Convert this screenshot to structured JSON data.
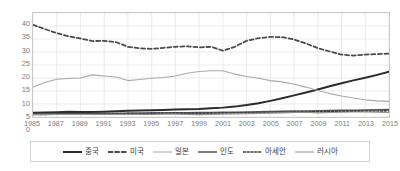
{
  "chart_data": {
    "type": "line",
    "title": "",
    "xlabel": "",
    "ylabel": "",
    "ylim": [
      0,
      40
    ],
    "ytick_step": 5,
    "grid": true,
    "legend_position": "bottom",
    "yticks": [
      "40",
      "35",
      "30",
      "25",
      "20",
      "15",
      "10",
      "5",
      "0"
    ],
    "x": [
      1985,
      1986,
      1987,
      1988,
      1989,
      1990,
      1991,
      1992,
      1993,
      1994,
      1995,
      1996,
      1997,
      1998,
      1999,
      2000,
      2001,
      2002,
      2003,
      2004,
      2005,
      2006,
      2007,
      2008,
      2009,
      2010,
      2011,
      2012,
      2013,
      2014,
      2015
    ],
    "xtick_labels": [
      "1985",
      "1987",
      "1989",
      "1991",
      "1993",
      "1995",
      "1997",
      "1999",
      "2001",
      "2003",
      "2005",
      "2007",
      "2009",
      "2011",
      "2013",
      "2015"
    ],
    "series": [
      {
        "name": "중국",
        "style": "solid",
        "width": 2.0,
        "color": "#2b2b2b",
        "values": [
          1.6,
          1.7,
          1.8,
          2.0,
          1.9,
          1.9,
          2.0,
          2.2,
          2.4,
          2.5,
          2.6,
          2.7,
          2.9,
          3.0,
          3.1,
          3.4,
          3.6,
          4.0,
          4.6,
          5.3,
          6.2,
          7.2,
          8.3,
          9.4,
          10.6,
          11.8,
          13.0,
          14.1,
          15.1,
          16.2,
          17.4
        ]
      },
      {
        "name": "미국",
        "style": "dashed",
        "width": 1.8,
        "color": "#4a4a4a",
        "values": [
          35.5,
          33.8,
          32.3,
          31.0,
          30.2,
          29.2,
          29.3,
          28.8,
          27.0,
          26.4,
          26.2,
          26.6,
          27.0,
          27.2,
          26.8,
          27.0,
          25.5,
          27.0,
          29.3,
          30.3,
          30.8,
          30.7,
          29.8,
          28.3,
          26.5,
          25.2,
          24.0,
          23.6,
          24.0,
          24.2,
          24.4
        ]
      },
      {
        "name": "일본",
        "style": "solid",
        "width": 1.1,
        "color": "#a8a8a8",
        "values": [
          11.5,
          13.3,
          14.5,
          14.8,
          15.0,
          16.2,
          15.8,
          15.4,
          14.0,
          14.4,
          14.9,
          15.2,
          15.8,
          16.8,
          17.5,
          17.8,
          17.8,
          16.5,
          15.6,
          14.9,
          14.0,
          13.5,
          12.6,
          11.5,
          10.2,
          9.0,
          8.1,
          7.3,
          6.6,
          6.2,
          6.0
        ]
      },
      {
        "name": "인도",
        "style": "solid",
        "width": 1.6,
        "color": "#555555",
        "values": [
          1.1,
          1.1,
          1.2,
          1.2,
          1.2,
          1.3,
          1.3,
          1.3,
          1.4,
          1.4,
          1.5,
          1.5,
          1.6,
          1.6,
          1.7,
          1.7,
          1.8,
          1.8,
          1.9,
          2.0,
          2.1,
          2.2,
          2.3,
          2.3,
          2.4,
          2.5,
          2.6,
          2.6,
          2.7,
          2.8,
          2.9
        ]
      },
      {
        "name": "아세안",
        "style": "dotted",
        "width": 1.6,
        "color": "#3f3f3f",
        "values": [
          1.0,
          1.0,
          1.1,
          1.1,
          1.2,
          1.2,
          1.3,
          1.3,
          1.4,
          1.4,
          1.5,
          1.5,
          1.5,
          1.4,
          1.4,
          1.5,
          1.5,
          1.6,
          1.6,
          1.7,
          1.8,
          1.8,
          1.9,
          2.0,
          2.0,
          2.1,
          2.2,
          2.2,
          2.3,
          2.3,
          2.4
        ]
      },
      {
        "name": "러시아",
        "style": "solid",
        "width": 1.1,
        "color": "#8f8f8f",
        "values": [
          0.9,
          0.9,
          1.0,
          1.0,
          1.0,
          1.0,
          1.0,
          1.0,
          1.0,
          1.0,
          1.0,
          1.1,
          1.1,
          1.0,
          0.9,
          1.0,
          1.1,
          1.2,
          1.3,
          1.4,
          1.5,
          1.6,
          1.7,
          1.8,
          1.6,
          1.7,
          1.8,
          1.9,
          1.9,
          1.8,
          1.7
        ]
      }
    ],
    "colors": {
      "grid": "#e2e2e2",
      "frame": "#c9c9c9",
      "tick_text": "#7d7d7d",
      "legend_text": "#3a3a3a",
      "legend_border": "#d0d0d0",
      "background": "#ffffff"
    }
  }
}
